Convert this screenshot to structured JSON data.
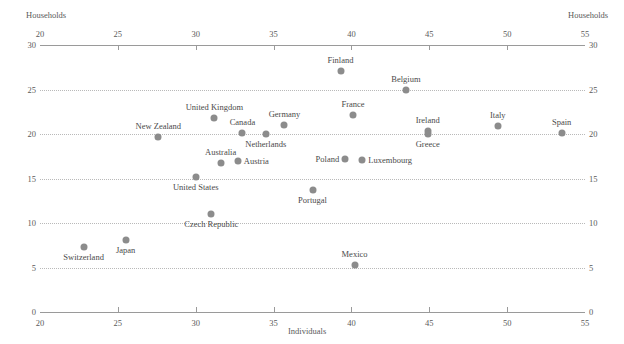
{
  "axis_titles": {
    "households_left": "Households",
    "households_right": "Households",
    "individuals": "Individuals"
  },
  "chart_data": {
    "type": "scatter",
    "title": "",
    "xlabel": "Individuals",
    "ylabel": "Households",
    "xlim": [
      20,
      55
    ],
    "ylim": [
      0,
      30
    ],
    "xticks": [
      20,
      25,
      30,
      35,
      40,
      45,
      50,
      55
    ],
    "yticks": [
      0,
      5,
      10,
      15,
      20,
      25,
      30
    ],
    "xtick_labels": [
      "20",
      "25",
      "30",
      "35",
      "40",
      "45",
      "50",
      "55"
    ],
    "ytick_labels": [
      "0",
      "5",
      "10",
      "15",
      "20",
      "25",
      "30"
    ],
    "grid": "horizontal-dotted",
    "legend": "none",
    "point_color": "#8c8c8c",
    "axis_color": "#9a9a9a",
    "grid_color": "#b9b9b9",
    "text_color": "#4a4a4a",
    "points": [
      {
        "label": "Switzerland",
        "x": 22.8,
        "y": 7.3,
        "label_pos": "below"
      },
      {
        "label": "Japan",
        "x": 25.5,
        "y": 8.1,
        "label_pos": "below"
      },
      {
        "label": "New Zealand",
        "x": 27.6,
        "y": 19.7,
        "label_pos": "above"
      },
      {
        "label": "United States",
        "x": 30.0,
        "y": 15.2,
        "label_pos": "below"
      },
      {
        "label": "Czech Republic",
        "x": 31.0,
        "y": 11.0,
        "label_pos": "below"
      },
      {
        "label": "United Kingdom",
        "x": 31.2,
        "y": 21.8,
        "label_pos": "above"
      },
      {
        "label": "Australia",
        "x": 31.6,
        "y": 16.7,
        "label_pos": "above"
      },
      {
        "label": "Austria",
        "x": 32.7,
        "y": 17.0,
        "label_pos": "right"
      },
      {
        "label": "Canada",
        "x": 33.0,
        "y": 20.1,
        "label_pos": "above"
      },
      {
        "label": "Netherlands",
        "x": 34.5,
        "y": 20.0,
        "label_pos": "below"
      },
      {
        "label": "Germany",
        "x": 35.7,
        "y": 21.0,
        "label_pos": "above"
      },
      {
        "label": "Portugal",
        "x": 37.5,
        "y": 13.7,
        "label_pos": "below"
      },
      {
        "label": "Finland",
        "x": 39.3,
        "y": 27.1,
        "label_pos": "above"
      },
      {
        "label": "Poland",
        "x": 39.6,
        "y": 17.2,
        "label_pos": "left"
      },
      {
        "label": "France",
        "x": 40.1,
        "y": 22.1,
        "label_pos": "above"
      },
      {
        "label": "Mexico",
        "x": 40.2,
        "y": 5.3,
        "label_pos": "above"
      },
      {
        "label": "Luxembourg",
        "x": 40.7,
        "y": 17.1,
        "label_pos": "right"
      },
      {
        "label": "Belgium",
        "x": 43.5,
        "y": 24.9,
        "label_pos": "above"
      },
      {
        "label": "Ireland",
        "x": 44.9,
        "y": 20.3,
        "label_pos": "above"
      },
      {
        "label": "Greece",
        "x": 44.9,
        "y": 20.0,
        "label_pos": "below"
      },
      {
        "label": "Italy",
        "x": 49.4,
        "y": 20.9,
        "label_pos": "above"
      },
      {
        "label": "Spain",
        "x": 53.5,
        "y": 20.1,
        "label_pos": "above"
      }
    ]
  }
}
